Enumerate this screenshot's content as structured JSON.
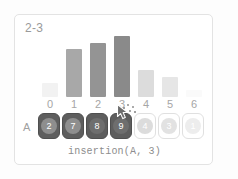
{
  "card": {
    "title": "2-3",
    "caption": "insertion(A, 3)",
    "array_label": "A",
    "border_color": "#e3e3e3",
    "background_color": "#ffffff"
  },
  "chart_data": {
    "type": "bar",
    "title": "2-3",
    "xlabel": "",
    "ylabel": "",
    "categories": [
      "0",
      "1",
      "2",
      "3",
      "4",
      "5",
      "6"
    ],
    "values": [
      2,
      7,
      8,
      9,
      4,
      3,
      1
    ],
    "ylim": [
      0,
      10
    ],
    "grid": false,
    "legend": null,
    "bar_colors": [
      "#f2f2f2",
      "#a8a8a8",
      "#949494",
      "#8a8a8a",
      "#dcdcdc",
      "#e6e6e6",
      "#fafafa"
    ]
  },
  "array": {
    "label": "A",
    "cells": [
      {
        "index": "0",
        "value": "2",
        "state": "sorted",
        "disc_color": "#8e8e8e"
      },
      {
        "index": "1",
        "value": "7",
        "state": "sorted",
        "disc_color": "#8e8e8e"
      },
      {
        "index": "2",
        "value": "8",
        "state": "sorted",
        "disc_color": "#6e6e6e"
      },
      {
        "index": "3",
        "value": "9",
        "state": "active",
        "disc_color": "#6e6e6e"
      },
      {
        "index": "4",
        "value": "4",
        "state": "unsorted",
        "disc_color": "#dcdcdc"
      },
      {
        "index": "5",
        "value": "3",
        "state": "unsorted",
        "disc_color": "#e2e2e2"
      },
      {
        "index": "6",
        "value": "1",
        "state": "unsorted",
        "disc_color": "#ededed"
      }
    ]
  },
  "cursor": {
    "visible": true,
    "click_effect": true
  },
  "colors": {
    "index_label": "#a6a6a6",
    "title": "#9a9a9a",
    "caption": "#8d8d8d",
    "cell_dark": "#5e5e5e",
    "cell_light_border": "#e0e0e0",
    "page_background": "#fdfdfd"
  }
}
